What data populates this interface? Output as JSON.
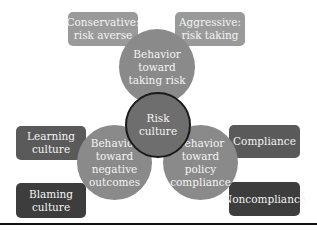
{
  "diagram": {
    "center": {
      "label": "Risk\nculture"
    },
    "branches": [
      {
        "label": "Behavior\ntoward\ntaking risk",
        "options": [
          {
            "label": "Conservative:\nrisk averse"
          },
          {
            "label": "Aggressive:\nrisk taking"
          }
        ]
      },
      {
        "label": "Behavior\ntoward\nnegative\noutcomes",
        "options": [
          {
            "label": "Learning\nculture"
          },
          {
            "label": "Blaming\nculture"
          }
        ]
      },
      {
        "label": "Behavior\ntoward\npolicy\ncompliance",
        "options": [
          {
            "label": "Compliance"
          },
          {
            "label": "Noncompliance"
          }
        ]
      }
    ]
  },
  "colors": {
    "light_box": "#9a9a9a",
    "circle": "#8a8a8a",
    "dark_box": "#5a5a5a",
    "darker_box": "#3d3d3d",
    "center": "#6e6e6e"
  }
}
